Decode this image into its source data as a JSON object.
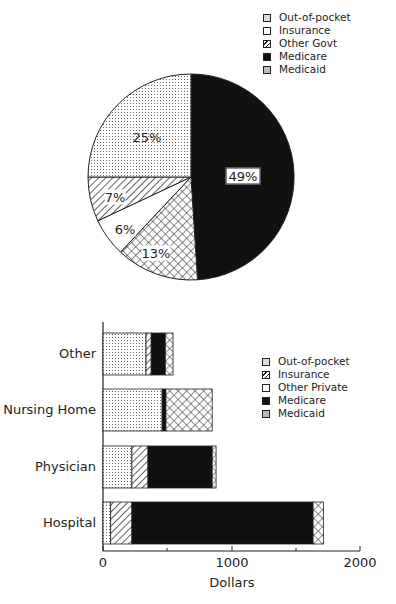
{
  "chart_data": [
    {
      "type": "pie",
      "title": "",
      "legend_position": "top-right",
      "legend": [
        "Out-of-pocket",
        "Insurance",
        "Other Govt",
        "Medicare",
        "Medicaid"
      ],
      "slices": [
        {
          "label": "Medicare",
          "value": 49,
          "display": "49%",
          "pattern": "solid-black"
        },
        {
          "label": "Medicaid",
          "value": 13,
          "display": "13%",
          "pattern": "crosshatch"
        },
        {
          "label": "Insurance",
          "value": 6,
          "display": "6%",
          "pattern": "white"
        },
        {
          "label": "Other Govt",
          "value": 7,
          "display": "7%",
          "pattern": "diagonal"
        },
        {
          "label": "Out-of-pocket",
          "value": 25,
          "display": "25%",
          "pattern": "dotted"
        }
      ]
    },
    {
      "type": "bar",
      "orientation": "horizontal",
      "stacked": true,
      "title": "",
      "xlabel": "Dollars",
      "ylabel": "",
      "xlim": [
        0,
        2000
      ],
      "xticks": [
        "0",
        "1000",
        "2000"
      ],
      "grid": false,
      "legend_position": "right",
      "legend": [
        "Out-of-pocket",
        "Insurance",
        "Other Private",
        "Medicare",
        "Medicaid"
      ],
      "categories": [
        "Other",
        "Nursing Home",
        "Physician",
        "Hospital"
      ],
      "series": [
        {
          "name": "Out-of-pocket",
          "pattern": "dotted",
          "values": [
            335,
            460,
            225,
            60
          ]
        },
        {
          "name": "Insurance",
          "pattern": "diagonal",
          "values": [
            40,
            0,
            125,
            165
          ]
        },
        {
          "name": "Other Private",
          "pattern": "white",
          "values": [
            0,
            0,
            0,
            0
          ]
        },
        {
          "name": "Medicare",
          "pattern": "solid-black",
          "values": [
            110,
            30,
            500,
            1410
          ]
        },
        {
          "name": "Medicaid",
          "pattern": "crosshatch",
          "values": [
            60,
            360,
            30,
            80
          ]
        }
      ]
    }
  ],
  "pie": {
    "legend": [
      {
        "label": "Out-of-pocket",
        "pattern": "dotted"
      },
      {
        "label": "Insurance",
        "pattern": "white"
      },
      {
        "label": "Other Govt",
        "pattern": "diagonal"
      },
      {
        "label": "Medicare",
        "pattern": "solid-black"
      },
      {
        "label": "Medicaid",
        "pattern": "crosshatch"
      }
    ],
    "labels": {
      "medicare": "49%",
      "medicaid": "13%",
      "insurance": "6%",
      "other_govt": "7%",
      "out_of_pocket": "25%"
    }
  },
  "bar": {
    "legend": [
      {
        "label": "Out-of-pocket",
        "pattern": "dotted"
      },
      {
        "label": "Insurance",
        "pattern": "diagonal"
      },
      {
        "label": "Other Private",
        "pattern": "white"
      },
      {
        "label": "Medicare",
        "pattern": "solid-black"
      },
      {
        "label": "Medicaid",
        "pattern": "crosshatch"
      }
    ],
    "categories": [
      "Other",
      "Nursing Home",
      "Physician",
      "Hospital"
    ],
    "xticks": [
      "0",
      "1000",
      "2000"
    ],
    "xlabel": "Dollars"
  },
  "colors": {
    "ink": "#222222",
    "background": "#ffffff"
  }
}
